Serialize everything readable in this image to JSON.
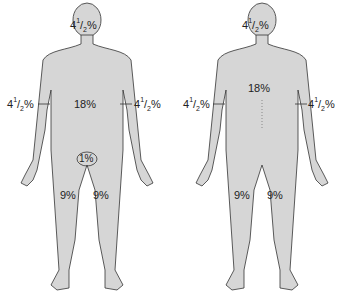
{
  "figures": [
    {
      "view": "front",
      "labels": {
        "head": {
          "whole": "4",
          "num": "1",
          "den": "2",
          "suffix": "%"
        },
        "trunk": "18%",
        "left_arm": {
          "whole": "4",
          "num": "1",
          "den": "2",
          "suffix": "%"
        },
        "right_arm": {
          "whole": "4",
          "num": "1",
          "den": "2",
          "suffix": "%"
        },
        "perineum": "1%",
        "left_leg": "9%",
        "right_leg": "9%"
      }
    },
    {
      "view": "back",
      "labels": {
        "head": {
          "whole": "4",
          "num": "1",
          "den": "2",
          "suffix": "%"
        },
        "trunk": "18%",
        "left_arm": {
          "whole": "4",
          "num": "1",
          "den": "2",
          "suffix": "%"
        },
        "right_arm": {
          "whole": "4",
          "num": "1",
          "den": "2",
          "suffix": "%"
        },
        "left_leg": "9%",
        "right_leg": "9%"
      }
    }
  ],
  "colors": {
    "body_fill": "#d6d6d6",
    "outline": "#333333",
    "text": "#222222"
  }
}
